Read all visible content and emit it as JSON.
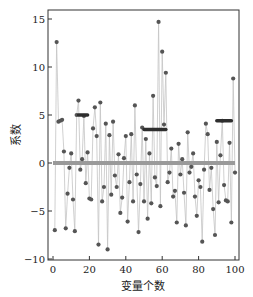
{
  "chart_data": {
    "type": "scatter",
    "title": "",
    "xlabel": "变量个数",
    "ylabel": "系数",
    "xlim": [
      -3,
      103
    ],
    "ylim": [
      -10,
      16
    ],
    "xticks": [
      0,
      20,
      40,
      60,
      80,
      100
    ],
    "yticks": [
      -10,
      -5,
      0,
      5,
      10,
      15
    ],
    "grid": false,
    "legend": null,
    "series": [
      {
        "name": "coefficients",
        "style": "markers with thin connecting line",
        "color": "#555555",
        "line_color": "#bbbbbb",
        "x": [
          1,
          2,
          3,
          4,
          5,
          6,
          7,
          8,
          9,
          10,
          11,
          12,
          13,
          14,
          15,
          16,
          17,
          18,
          19,
          20,
          21,
          22,
          23,
          24,
          25,
          26,
          27,
          28,
          29,
          30,
          31,
          32,
          33,
          34,
          35,
          36,
          37,
          38,
          39,
          40,
          41,
          42,
          43,
          44,
          45,
          46,
          47,
          48,
          49,
          50,
          51,
          52,
          53,
          54,
          55,
          56,
          57,
          58,
          59,
          60,
          61,
          62,
          63,
          64,
          65,
          66,
          67,
          68,
          69,
          70,
          71,
          72,
          73,
          74,
          75,
          76,
          77,
          78,
          79,
          80,
          81,
          82,
          83,
          84,
          85,
          86,
          87,
          88,
          89,
          90,
          91,
          92,
          93,
          94,
          95,
          96,
          97,
          98,
          99,
          100
        ],
        "y": [
          -7.0,
          12.6,
          4.3,
          4.4,
          4.5,
          1.2,
          -6.8,
          -3.2,
          -0.5,
          1.0,
          -3.8,
          -7.1,
          5.0,
          6.5,
          -0.7,
          0.4,
          4.9,
          -2.1,
          1.1,
          -3.7,
          -3.8,
          3.6,
          5.8,
          2.8,
          -8.5,
          6.3,
          -4.0,
          -2.5,
          4.1,
          -9.0,
          2.9,
          -3.3,
          4.3,
          -1.3,
          -2.5,
          0.9,
          -5.2,
          -3.6,
          0.5,
          2.8,
          -6.1,
          -2.0,
          3.0,
          -4.0,
          6.0,
          -1.2,
          -7.2,
          -2.2,
          3.7,
          -4.0,
          2.5,
          -5.8,
          1.0,
          -4.2,
          7.0,
          -1.5,
          -2.4,
          14.7,
          -4.5,
          11.6,
          4.0,
          9.4,
          -2.0,
          -1.0,
          1.5,
          -3.5,
          -2.9,
          -6.2,
          2.0,
          -1.2,
          0.4,
          -3.1,
          -6.5,
          3.2,
          -1.0,
          -0.4,
          1.0,
          -3.5,
          -5.5,
          -1.8,
          -2.5,
          -8.2,
          -0.7,
          4.1,
          3.0,
          -2.8,
          -0.5,
          -4.8,
          -7.5,
          2.2,
          -4.1,
          0.8,
          4.4,
          -2.3,
          -3.9,
          -4.0,
          2.1,
          -6.2,
          8.8,
          -1.0
        ]
      },
      {
        "name": "zero-baseline",
        "style": "thick gray horizontal line",
        "color": "#999999",
        "x": [
          0,
          100
        ],
        "y": [
          0,
          0
        ]
      },
      {
        "name": "group-mean-1",
        "style": "thick dark horizontal segment",
        "color": "#333333",
        "x": [
          14,
          19
        ],
        "y": [
          5.0,
          5.0
        ]
      },
      {
        "name": "group-mean-2",
        "style": "thick dark horizontal segment",
        "color": "#333333",
        "x": [
          50,
          62
        ],
        "y": [
          3.5,
          3.5
        ]
      },
      {
        "name": "group-mean-3",
        "style": "thick dark horizontal segment",
        "color": "#333333",
        "x": [
          90,
          98
        ],
        "y": [
          4.4,
          4.4
        ]
      }
    ]
  },
  "plot": {
    "frame": {
      "left": 48,
      "top": 10,
      "right": 239,
      "bottom": 260
    },
    "x_axis_px": {
      "x0": 53,
      "per_unit": 1.82
    },
    "y_axis_px": {
      "y0": 163,
      "per_unit": 9.6
    },
    "colors": {
      "frame": "#333333",
      "marker": "#555555",
      "line": "#c4c4c4",
      "baseline": "#9a9a9a",
      "mean": "#2e2e2e"
    }
  }
}
